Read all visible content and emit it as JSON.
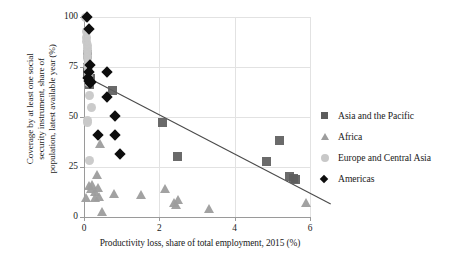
{
  "chart_data": {
    "type": "scatter",
    "title": "",
    "xlabel": "Productivity loss, share of total employment, 2015 (%)",
    "ylabel": "Coverage by at least one social\nsecurity instrument, share of\npopulation, latest available year (%)",
    "xlim": [
      0,
      6
    ],
    "ylim": [
      0,
      100
    ],
    "xticks": [
      0,
      2,
      4,
      6
    ],
    "yticks": [
      0,
      25,
      50,
      75,
      100
    ],
    "xtick_labels": [
      "0",
      "2",
      "4",
      "6"
    ],
    "ytick_labels": [
      "0",
      "25",
      "50",
      "75",
      "100"
    ],
    "grid": "both-light",
    "legend_position": "right",
    "series": [
      {
        "name": "Asia and the Pacific",
        "marker": "square",
        "color": "#5d5d5d",
        "points": [
          [
            0.08,
            81.5
          ],
          [
            0.1,
            75.0
          ],
          [
            0.1,
            71.5
          ],
          [
            0.12,
            68.5
          ],
          [
            0.14,
            66.5
          ],
          [
            0.16,
            69.5
          ],
          [
            0.75,
            63.5
          ],
          [
            2.08,
            47.5
          ],
          [
            2.47,
            30.5
          ],
          [
            4.85,
            28.0
          ],
          [
            5.18,
            38.5
          ],
          [
            5.45,
            20.5
          ],
          [
            5.55,
            19.5
          ],
          [
            5.62,
            19.0
          ]
        ]
      },
      {
        "name": "Africa",
        "marker": "triangle",
        "color": "#9d9d9d",
        "points": [
          [
            0.05,
            9.5
          ],
          [
            0.12,
            15.5
          ],
          [
            0.18,
            14.0
          ],
          [
            0.22,
            16.0
          ],
          [
            0.28,
            12.5
          ],
          [
            0.3,
            9.5
          ],
          [
            0.34,
            21.0
          ],
          [
            0.38,
            14.5
          ],
          [
            0.4,
            10.0
          ],
          [
            0.42,
            36.5
          ],
          [
            0.48,
            2.5
          ],
          [
            0.8,
            11.5
          ],
          [
            1.52,
            11.0
          ],
          [
            2.15,
            14.0
          ],
          [
            2.38,
            7.0
          ],
          [
            2.45,
            6.0
          ],
          [
            2.5,
            8.5
          ],
          [
            3.32,
            4.0
          ],
          [
            5.9,
            7.0
          ]
        ]
      },
      {
        "name": "Europe and Central Asia",
        "marker": "circle",
        "color": "#c8c8c8",
        "points": [
          [
            0.05,
            100.0
          ],
          [
            0.06,
            93.0
          ],
          [
            0.07,
            90.0
          ],
          [
            0.07,
            88.0
          ],
          [
            0.08,
            86.0
          ],
          [
            0.08,
            84.5
          ],
          [
            0.09,
            83.0
          ],
          [
            0.09,
            81.0
          ],
          [
            0.1,
            79.5
          ],
          [
            0.1,
            76.0
          ],
          [
            0.11,
            74.0
          ],
          [
            0.12,
            72.0
          ],
          [
            0.12,
            70.0
          ],
          [
            0.13,
            67.5
          ],
          [
            0.14,
            61.0
          ],
          [
            0.2,
            55.0
          ],
          [
            0.1,
            48.5
          ],
          [
            0.1,
            47.5
          ],
          [
            0.14,
            28.5
          ]
        ]
      },
      {
        "name": "Americas",
        "marker": "diamond",
        "color": "#0d0d0d",
        "points": [
          [
            0.07,
            100.0
          ],
          [
            0.12,
            94.0
          ],
          [
            0.15,
            76.0
          ],
          [
            0.13,
            72.5
          ],
          [
            0.1,
            69.5
          ],
          [
            0.12,
            68.0
          ],
          [
            0.16,
            67.0
          ],
          [
            0.18,
            67.5
          ],
          [
            0.6,
            72.5
          ],
          [
            0.62,
            60.0
          ],
          [
            0.82,
            50.5
          ],
          [
            0.38,
            41.0
          ],
          [
            0.82,
            41.0
          ],
          [
            0.95,
            31.5
          ]
        ]
      }
    ],
    "trendline": {
      "x_start": 0.12,
      "y_start": 69.5,
      "x_end": 6.55,
      "y_end": 6.5,
      "color": "#4a4a4a"
    }
  },
  "legend": {
    "entries": [
      {
        "label": "Asia and the Pacific",
        "marker": "square"
      },
      {
        "label": "Africa",
        "marker": "triangle"
      },
      {
        "label": "Europe and Central Asia",
        "marker": "circle"
      },
      {
        "label": "Americas",
        "marker": "diamond"
      }
    ]
  }
}
